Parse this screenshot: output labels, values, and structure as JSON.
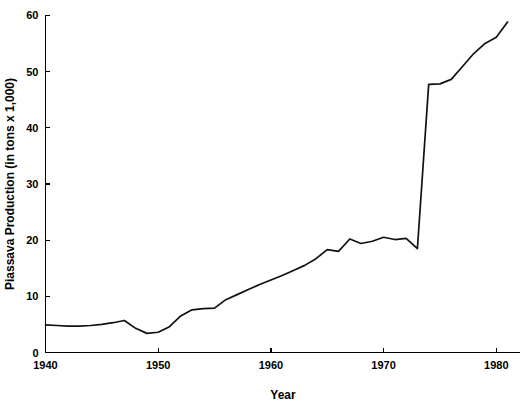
{
  "chart_data": {
    "type": "line",
    "title": "",
    "xlabel": "Year",
    "ylabel": "Piassava Production (in tons x 1,000)",
    "xlim": [
      1940,
      1981
    ],
    "ylim": [
      0,
      60
    ],
    "xticks": [
      1940,
      1950,
      1960,
      1970,
      1980
    ],
    "xtick_labels": [
      "1940",
      "1950",
      "1960",
      "1970",
      "1980"
    ],
    "yticks": [
      0,
      10,
      20,
      30,
      40,
      50,
      60
    ],
    "ytick_labels": [
      "0",
      "10",
      "20",
      "30",
      "40",
      "50",
      "60"
    ],
    "grid": false,
    "legend": "none",
    "series": [
      {
        "name": "Piassava Production",
        "color": "#111111",
        "x": [
          1940,
          1941,
          1942,
          1943,
          1944,
          1945,
          1946,
          1947,
          1948,
          1949,
          1950,
          1951,
          1952,
          1953,
          1954,
          1955,
          1956,
          1957,
          1958,
          1959,
          1960,
          1961,
          1962,
          1963,
          1964,
          1965,
          1966,
          1967,
          1968,
          1969,
          1970,
          1971,
          1972,
          1973,
          1974,
          1975,
          1976,
          1977,
          1978,
          1979,
          1980,
          1981
        ],
        "values": [
          4.9,
          4.8,
          4.7,
          4.7,
          4.8,
          5.0,
          5.3,
          5.7,
          4.3,
          3.4,
          3.6,
          4.6,
          6.5,
          7.6,
          7.8,
          7.9,
          9.4,
          10.3,
          11.2,
          12.1,
          12.9,
          13.7,
          14.6,
          15.5,
          16.7,
          18.3,
          18.0,
          20.2,
          19.4,
          19.8,
          20.5,
          20.1,
          20.3,
          18.5,
          47.7,
          47.8,
          48.6,
          50.9,
          53.2,
          55.0,
          56.1,
          58.8
        ]
      }
    ]
  }
}
